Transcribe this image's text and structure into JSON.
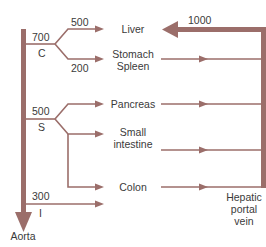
{
  "diagram": {
    "color": "#9b6e6a",
    "source": {
      "label": "Aorta"
    },
    "sink": {
      "label_line1": "Hepatic",
      "label_line2": "portal",
      "label_line3": "vein",
      "flow": "1000"
    },
    "branches": [
      {
        "id": "C",
        "letter": "C",
        "flow": "700"
      },
      {
        "id": "S",
        "letter": "S",
        "flow": "500"
      },
      {
        "id": "I",
        "letter": "I",
        "flow": "300"
      }
    ],
    "organs": [
      {
        "label_line1": "Liver",
        "label_line2": "",
        "flow": "500"
      },
      {
        "label_line1": "Stomach",
        "label_line2": "Spleen",
        "flow": "200"
      },
      {
        "label_line1": "Pancreas",
        "label_line2": "",
        "flow": ""
      },
      {
        "label_line1": "Small",
        "label_line2": "intestine",
        "flow": ""
      },
      {
        "label_line1": "Colon",
        "label_line2": "",
        "flow": ""
      }
    ]
  }
}
